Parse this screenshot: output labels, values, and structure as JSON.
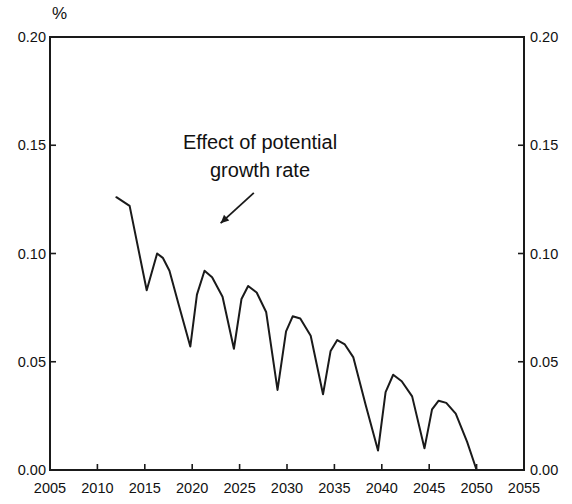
{
  "chart_data": {
    "type": "line",
    "title": "",
    "subtitle": "",
    "unit_label": "%",
    "xlabel": "",
    "ylabel": "",
    "xlim": [
      2005,
      2055
    ],
    "ylim": [
      0.0,
      0.2
    ],
    "grid": false,
    "legend": null,
    "x_ticks": [
      2005,
      2010,
      2015,
      2020,
      2025,
      2030,
      2035,
      2040,
      2045,
      2050,
      2055
    ],
    "x_tick_labels": [
      "2005",
      "2010",
      "2015",
      "2020",
      "2025",
      "2030",
      "2035",
      "2040",
      "2045",
      "2050",
      "2055"
    ],
    "y_ticks": [
      0.0,
      0.05,
      0.1,
      0.15,
      0.2
    ],
    "y_tick_labels_left": [
      "0.00",
      "0.05",
      "0.10",
      "0.15",
      "0.20"
    ],
    "y_tick_labels_right": [
      "0.00",
      "0.05",
      "0.10",
      "0.15",
      "0.20"
    ],
    "annotations": [
      {
        "name": "effect-of-potential-growth-rate",
        "lines": [
          "Effect of potential",
          "growth rate"
        ],
        "arrow": {
          "from_x": 2026.5,
          "from_y": 0.128,
          "to_x": 2023.0,
          "to_y": 0.114
        }
      }
    ],
    "series": [
      {
        "name": "Effect of potential growth rate",
        "color": "#1a1a1a",
        "x": [
          2012.0,
          2013.4,
          2015.2,
          2016.3,
          2016.9,
          2017.6,
          2018.6,
          2019.8,
          2020.5,
          2021.3,
          2022.1,
          2023.2,
          2024.4,
          2025.2,
          2025.9,
          2026.8,
          2027.8,
          2029.0,
          2029.9,
          2030.6,
          2031.4,
          2032.5,
          2033.8,
          2034.6,
          2035.3,
          2036.1,
          2037.0,
          2038.3,
          2039.6,
          2040.4,
          2041.2,
          2042.1,
          2043.2,
          2044.5,
          2045.3,
          2046.0,
          2046.8,
          2047.8,
          2049.0,
          2050.0,
          2055.0
        ],
        "y": [
          0.126,
          0.122,
          0.083,
          0.1,
          0.098,
          0.092,
          0.076,
          0.057,
          0.081,
          0.092,
          0.089,
          0.08,
          0.056,
          0.079,
          0.085,
          0.082,
          0.073,
          0.037,
          0.064,
          0.071,
          0.07,
          0.062,
          0.035,
          0.055,
          0.06,
          0.058,
          0.052,
          0.03,
          0.009,
          0.036,
          0.044,
          0.041,
          0.034,
          0.01,
          0.028,
          0.032,
          0.031,
          0.026,
          0.013,
          0.0,
          0.0
        ]
      }
    ]
  }
}
